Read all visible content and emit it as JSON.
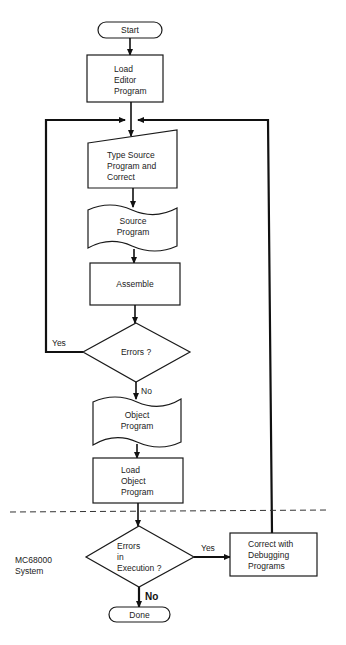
{
  "diagram": {
    "type": "flowchart",
    "nodes": {
      "start": {
        "shape": "terminal",
        "label": "Start"
      },
      "load_editor": {
        "shape": "process",
        "lines": [
          "Load",
          "Editor",
          "Program"
        ]
      },
      "type_source": {
        "shape": "manual-input",
        "lines": [
          "Type Source",
          "Program and",
          "Correct"
        ]
      },
      "source_program": {
        "shape": "punched-tape",
        "lines": [
          "Source",
          "Program"
        ]
      },
      "assemble": {
        "shape": "process",
        "label": "Assemble"
      },
      "errors": {
        "shape": "decision",
        "label": "Errors ?"
      },
      "object_program": {
        "shape": "punched-tape",
        "lines": [
          "Object",
          "Program"
        ]
      },
      "load_object": {
        "shape": "process",
        "lines": [
          "Load",
          "Object",
          "Program"
        ]
      },
      "errors_execution": {
        "shape": "decision",
        "lines": [
          "Errors",
          "in",
          "Execution ?"
        ]
      },
      "correct_debug": {
        "shape": "process",
        "lines": [
          "Correct with",
          "Debugging",
          "Programs"
        ]
      },
      "done": {
        "shape": "terminal",
        "label": "Done"
      }
    },
    "edge_labels": {
      "errors_yes": "Yes",
      "errors_no": "No",
      "execution_yes": "Yes",
      "execution_no": "No"
    },
    "edges": [
      {
        "from": "start",
        "to": "load_editor"
      },
      {
        "from": "load_editor",
        "to": "type_source"
      },
      {
        "from": "type_source",
        "to": "source_program"
      },
      {
        "from": "source_program",
        "to": "assemble"
      },
      {
        "from": "assemble",
        "to": "errors"
      },
      {
        "from": "errors",
        "to": "type_source",
        "label": "Yes"
      },
      {
        "from": "errors",
        "to": "object_program",
        "label": "No"
      },
      {
        "from": "object_program",
        "to": "load_object"
      },
      {
        "from": "load_object",
        "to": "errors_execution"
      },
      {
        "from": "errors_execution",
        "to": "correct_debug",
        "label": "Yes"
      },
      {
        "from": "errors_execution",
        "to": "done",
        "label": "No"
      },
      {
        "from": "correct_debug",
        "to": "type_source"
      }
    ],
    "region_label": [
      "MC68000",
      "System"
    ]
  }
}
